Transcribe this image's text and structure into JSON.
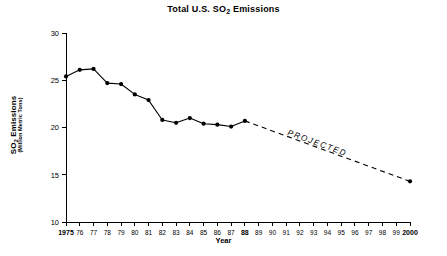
{
  "chart_data": {
    "type": "line",
    "title": "Total U.S. SO2 Emissions",
    "title_prefix": "Total U.S. SO",
    "title_sub": "2",
    "title_suffix": " Emissions",
    "xlabel": "Year",
    "ylabel": "SO2 Emissions",
    "ylabel_prefix": "SO",
    "ylabel_sub": "2",
    "ylabel_suffix": " Emissions",
    "ylabel_units": "(Million Metric Tons)",
    "ylim": [
      10,
      30
    ],
    "ytick_labels": [
      "30",
      "25",
      "20",
      "15",
      "10"
    ],
    "ytick_values": [
      30,
      25,
      20,
      15,
      10
    ],
    "xlim": [
      1975,
      2000
    ],
    "grid": false,
    "legend": "none",
    "annotations": [
      {
        "text": "PROJECTED",
        "style": "italic",
        "along": "projected-line",
        "x": 1993.2,
        "y": 18.1
      }
    ],
    "xtick_labels": [
      "1975",
      "76",
      "77",
      "78",
      "79",
      "80",
      "81",
      "82",
      "83",
      "84",
      "85",
      "86",
      "87",
      "88",
      "89",
      "90",
      "91",
      "92",
      "93",
      "94",
      "95",
      "96",
      "97",
      "98",
      "99",
      "2000"
    ],
    "xtick_values": [
      1975,
      1976,
      1977,
      1978,
      1979,
      1980,
      1981,
      1982,
      1983,
      1984,
      1985,
      1986,
      1987,
      1988,
      1989,
      1990,
      1991,
      1992,
      1993,
      1994,
      1995,
      1996,
      1997,
      1998,
      1999,
      2000
    ],
    "xtick_bold": [
      true,
      false,
      false,
      false,
      false,
      false,
      false,
      false,
      false,
      false,
      false,
      false,
      false,
      true,
      false,
      false,
      false,
      false,
      false,
      false,
      false,
      false,
      false,
      false,
      false,
      true
    ],
    "series": [
      {
        "name": "Historical",
        "style": "solid",
        "markers": true,
        "x": [
          1975,
          1976,
          1977,
          1978,
          1979,
          1980,
          1981,
          1982,
          1983,
          1984,
          1985,
          1986,
          1987,
          1988
        ],
        "values": [
          25.4,
          26.1,
          26.2,
          24.7,
          24.6,
          23.5,
          22.9,
          20.8,
          20.5,
          21.0,
          20.4,
          20.3,
          20.1,
          20.7
        ]
      },
      {
        "name": "Projected",
        "style": "dashed",
        "markers": false,
        "x": [
          1988,
          2000
        ],
        "values": [
          20.7,
          14.3
        ]
      }
    ]
  }
}
